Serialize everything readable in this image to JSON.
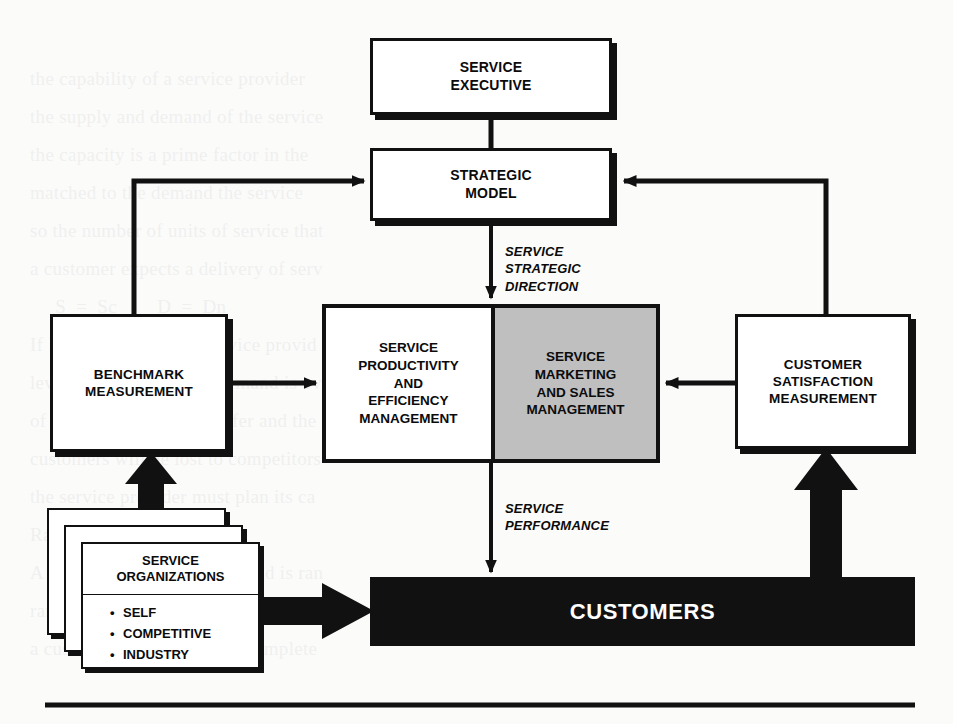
{
  "document": {
    "title": "Service Management Model",
    "background_color": "#fbfbfa",
    "ink_color": "#111111",
    "shaded_cell_color": "#bfbfbf",
    "bottom_rule": true
  },
  "nodes": {
    "service_executive": {
      "label": "SERVICE\nEXECUTIVE"
    },
    "strategic_model": {
      "label": "STRATEGIC\nMODEL"
    },
    "benchmark_measurement": {
      "label": "BENCHMARK\nMEASUREMENT"
    },
    "customer_satisfaction_measurement": {
      "label": "CUSTOMER\nSATISFACTION\nMEASUREMENT"
    },
    "service_productivity": {
      "label": "SERVICE\nPRODUCTIVITY\nAND\nEFFICIENCY\nMANAGEMENT"
    },
    "service_marketing": {
      "label": "SERVICE\nMARKETING\nAND SALES\nMANAGEMENT"
    },
    "customers": {
      "label": "CUSTOMERS"
    },
    "service_organizations": {
      "title": "SERVICE\nORGANIZATIONS",
      "items": [
        "SELF",
        "COMPETITIVE",
        "INDUSTRY"
      ]
    }
  },
  "flow_labels": {
    "strategic_direction": "SERVICE\nSTRATEGIC\nDIRECTION",
    "service_performance": "SERVICE\nPERFORMANCE"
  },
  "ghost_text": {
    "lines": [
      "the capability of a service provider",
      "the supply and demand of the service",
      "the capacity is a prime factor in the",
      "matched to the demand the service",
      "so the number of units of service that",
      "a customer expects a delivery of serv",
      "     S  =  Sc        D  =  Dn",
      "If D is less than S the service provid",
      "level of capacity. If the demand is ove",
      "of service quality will suffer and the",
      "customers will be lost to competitors",
      "the service provider must plan its ca",
      "Randomness of demand",
      "A great deal of service demand is ran",
      "random demand. In the service enviro",
      "a customer that the time to complete"
    ]
  }
}
